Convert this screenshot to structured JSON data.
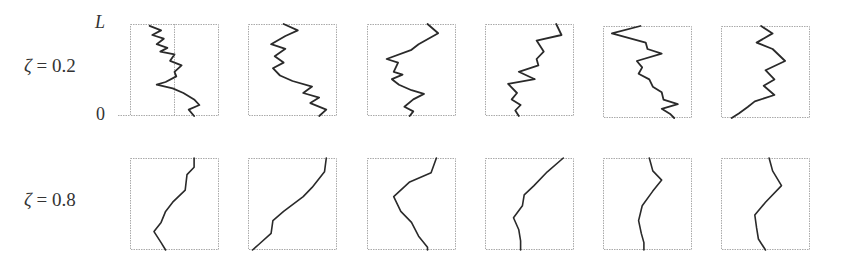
{
  "rows": [
    {
      "label_symbol": "ζ",
      "label_rest": " = 0.2",
      "y_axis": {
        "top_tick": "L",
        "bottom_tick": "0"
      }
    },
    {
      "label_symbol": "ζ",
      "label_rest": " = 0.8"
    }
  ],
  "chart_data": {
    "type": "line",
    "title": "",
    "row_labels": [
      "ζ = 0.2",
      "ζ = 0.8"
    ],
    "ylabel_ticks": [
      "0",
      "L"
    ],
    "ylim": [
      0,
      1
    ],
    "grid": false,
    "panels": [
      [
        [
          [
            0.22,
            0.02
          ],
          [
            0.35,
            0.07
          ],
          [
            0.25,
            0.12
          ],
          [
            0.38,
            0.16
          ],
          [
            0.3,
            0.22
          ],
          [
            0.42,
            0.26
          ],
          [
            0.34,
            0.3
          ],
          [
            0.5,
            0.33
          ],
          [
            0.45,
            0.4
          ],
          [
            0.58,
            0.45
          ],
          [
            0.5,
            0.52
          ],
          [
            0.52,
            0.57
          ],
          [
            0.4,
            0.63
          ],
          [
            0.3,
            0.66
          ],
          [
            0.48,
            0.7
          ],
          [
            0.6,
            0.75
          ],
          [
            0.72,
            0.82
          ],
          [
            0.78,
            0.88
          ],
          [
            0.66,
            0.93
          ],
          [
            0.72,
            1.0
          ]
        ],
        [
          [
            0.4,
            0.0
          ],
          [
            0.56,
            0.07
          ],
          [
            0.42,
            0.13
          ],
          [
            0.26,
            0.22
          ],
          [
            0.42,
            0.27
          ],
          [
            0.3,
            0.35
          ],
          [
            0.4,
            0.42
          ],
          [
            0.28,
            0.48
          ],
          [
            0.36,
            0.56
          ],
          [
            0.5,
            0.62
          ],
          [
            0.72,
            0.68
          ],
          [
            0.62,
            0.75
          ],
          [
            0.8,
            0.8
          ],
          [
            0.7,
            0.86
          ],
          [
            0.88,
            0.93
          ],
          [
            0.8,
            1.0
          ]
        ],
        [
          [
            0.68,
            0.0
          ],
          [
            0.8,
            0.1
          ],
          [
            0.58,
            0.22
          ],
          [
            0.5,
            0.28
          ],
          [
            0.22,
            0.38
          ],
          [
            0.35,
            0.42
          ],
          [
            0.3,
            0.52
          ],
          [
            0.4,
            0.55
          ],
          [
            0.28,
            0.6
          ],
          [
            0.36,
            0.66
          ],
          [
            0.5,
            0.72
          ],
          [
            0.64,
            0.76
          ],
          [
            0.52,
            0.82
          ],
          [
            0.42,
            0.9
          ],
          [
            0.52,
            0.95
          ],
          [
            0.48,
            1.0
          ]
        ],
        [
          [
            0.8,
            0.0
          ],
          [
            0.86,
            0.12
          ],
          [
            0.58,
            0.18
          ],
          [
            0.66,
            0.3
          ],
          [
            0.58,
            0.38
          ],
          [
            0.6,
            0.45
          ],
          [
            0.38,
            0.52
          ],
          [
            0.56,
            0.6
          ],
          [
            0.26,
            0.65
          ],
          [
            0.36,
            0.75
          ],
          [
            0.3,
            0.82
          ],
          [
            0.4,
            0.88
          ],
          [
            0.34,
            0.94
          ],
          [
            0.38,
            1.0
          ]
        ],
        [
          [
            0.42,
            0.0
          ],
          [
            0.1,
            0.08
          ],
          [
            0.48,
            0.18
          ],
          [
            0.5,
            0.25
          ],
          [
            0.66,
            0.3
          ],
          [
            0.38,
            0.38
          ],
          [
            0.44,
            0.45
          ],
          [
            0.4,
            0.52
          ],
          [
            0.52,
            0.58
          ],
          [
            0.56,
            0.66
          ],
          [
            0.66,
            0.72
          ],
          [
            0.68,
            0.8
          ],
          [
            0.84,
            0.85
          ],
          [
            0.66,
            0.9
          ],
          [
            0.76,
            0.96
          ],
          [
            0.8,
            1.0
          ]
        ],
        [
          [
            0.45,
            0.0
          ],
          [
            0.58,
            0.08
          ],
          [
            0.4,
            0.18
          ],
          [
            0.58,
            0.25
          ],
          [
            0.72,
            0.38
          ],
          [
            0.5,
            0.48
          ],
          [
            0.6,
            0.58
          ],
          [
            0.48,
            0.65
          ],
          [
            0.6,
            0.75
          ],
          [
            0.38,
            0.82
          ],
          [
            0.3,
            0.88
          ],
          [
            0.2,
            0.95
          ],
          [
            0.12,
            1.0
          ]
        ]
      ],
      [
        [
          [
            0.72,
            0.0
          ],
          [
            0.72,
            0.1
          ],
          [
            0.64,
            0.18
          ],
          [
            0.62,
            0.35
          ],
          [
            0.48,
            0.48
          ],
          [
            0.4,
            0.58
          ],
          [
            0.35,
            0.7
          ],
          [
            0.27,
            0.8
          ],
          [
            0.35,
            0.92
          ],
          [
            0.4,
            1.0
          ]
        ],
        [
          [
            0.88,
            0.0
          ],
          [
            0.86,
            0.15
          ],
          [
            0.72,
            0.32
          ],
          [
            0.62,
            0.42
          ],
          [
            0.4,
            0.58
          ],
          [
            0.28,
            0.68
          ],
          [
            0.26,
            0.82
          ],
          [
            0.12,
            0.94
          ],
          [
            0.05,
            1.0
          ]
        ],
        [
          [
            0.78,
            0.0
          ],
          [
            0.72,
            0.16
          ],
          [
            0.48,
            0.26
          ],
          [
            0.3,
            0.42
          ],
          [
            0.38,
            0.58
          ],
          [
            0.5,
            0.7
          ],
          [
            0.58,
            0.85
          ],
          [
            0.68,
            0.97
          ],
          [
            0.68,
            1.0
          ]
        ],
        [
          [
            0.88,
            0.0
          ],
          [
            0.7,
            0.15
          ],
          [
            0.55,
            0.3
          ],
          [
            0.44,
            0.4
          ],
          [
            0.42,
            0.52
          ],
          [
            0.32,
            0.65
          ],
          [
            0.38,
            0.78
          ],
          [
            0.4,
            0.9
          ],
          [
            0.4,
            1.0
          ]
        ],
        [
          [
            0.52,
            0.0
          ],
          [
            0.56,
            0.14
          ],
          [
            0.66,
            0.24
          ],
          [
            0.56,
            0.36
          ],
          [
            0.44,
            0.52
          ],
          [
            0.4,
            0.68
          ],
          [
            0.43,
            0.82
          ],
          [
            0.46,
            0.92
          ],
          [
            0.46,
            1.0
          ]
        ],
        [
          [
            0.54,
            0.0
          ],
          [
            0.58,
            0.14
          ],
          [
            0.68,
            0.3
          ],
          [
            0.5,
            0.48
          ],
          [
            0.38,
            0.62
          ],
          [
            0.4,
            0.76
          ],
          [
            0.42,
            0.88
          ],
          [
            0.5,
            1.0
          ]
        ]
      ]
    ]
  },
  "layout": {
    "box_x": [
      130,
      248,
      367,
      485,
      603,
      721
    ],
    "box_w": 89,
    "row_y": [
      24,
      158
    ],
    "box_h": 92,
    "center_line_row0_col0": true
  }
}
